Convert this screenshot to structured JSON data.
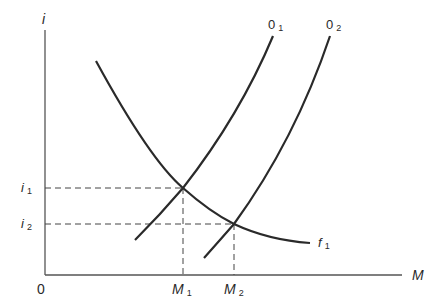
{
  "diagram": {
    "type": "economics-curve-diagram",
    "axes": {
      "y_label": "i",
      "x_label": "M",
      "origin_label": "0"
    },
    "curves": [
      {
        "id": "O1",
        "label": "0",
        "subscript": "1",
        "shape": "upward-sloping"
      },
      {
        "id": "O2",
        "label": "0",
        "subscript": "2",
        "shape": "upward-sloping"
      },
      {
        "id": "f1",
        "label": "f",
        "subscript": "1",
        "shape": "downward-sloping"
      }
    ],
    "y_ticks": [
      {
        "label": "i",
        "subscript": "1"
      },
      {
        "label": "i",
        "subscript": "2"
      }
    ],
    "x_ticks": [
      {
        "label": "M",
        "subscript": "1"
      },
      {
        "label": "M",
        "subscript": "2"
      }
    ],
    "intersections": [
      {
        "curves": [
          "O1",
          "f1"
        ],
        "x": "M1",
        "y": "i1"
      },
      {
        "curves": [
          "O2",
          "f1"
        ],
        "x": "M2",
        "y": "i2"
      }
    ],
    "colors": {
      "line": "#2a2a2a",
      "axis": "#555555",
      "dash": "#444444"
    }
  }
}
